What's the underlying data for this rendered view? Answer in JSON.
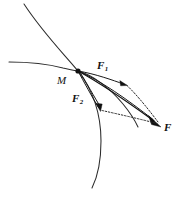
{
  "figure": {
    "kind": "force-decomposition-diagram",
    "title": "",
    "background_color": "#ffffff",
    "ink_color": "#111111",
    "curve_color": "#2b2b2b",
    "width": 176,
    "height": 200
  },
  "labels": {
    "point_M": "M",
    "force_F1_base": "F",
    "force_F1_sub": "1",
    "force_F2_base": "F",
    "force_F2_sub": "2",
    "force_F": "F"
  },
  "geometry": {
    "point_M": {
      "x": 78,
      "y": 71
    },
    "point_F": {
      "x": 161,
      "y": 127
    },
    "tip_F1": {
      "x": 126,
      "y": 85
    },
    "tip_F2": {
      "x": 100,
      "y": 110
    },
    "steep_curve": {
      "start": {
        "x": 24,
        "y": 4
      },
      "end": {
        "x": 92,
        "y": 188
      },
      "through_M": true
    },
    "flat_curve": {
      "start": {
        "x": 9,
        "y": 62
      },
      "end": {
        "x": 137,
        "y": 126
      },
      "through_M": true
    },
    "vectors": [
      {
        "name": "F1",
        "from": "M",
        "to": "tip_F1",
        "style": "solid-arrow"
      },
      {
        "name": "F2",
        "from": "M",
        "to": "tip_F2",
        "style": "solid-arrow"
      },
      {
        "name": "F",
        "from": "M",
        "to": "point_F",
        "style": "solid-arrow-bold"
      }
    ],
    "construction_lines": [
      {
        "name": "F1-to-F",
        "from": "tip_F1",
        "to": "point_F",
        "style": "dotted"
      },
      {
        "name": "F2-to-F",
        "from": "tip_F2",
        "to": "point_F",
        "style": "dotted"
      }
    ]
  }
}
